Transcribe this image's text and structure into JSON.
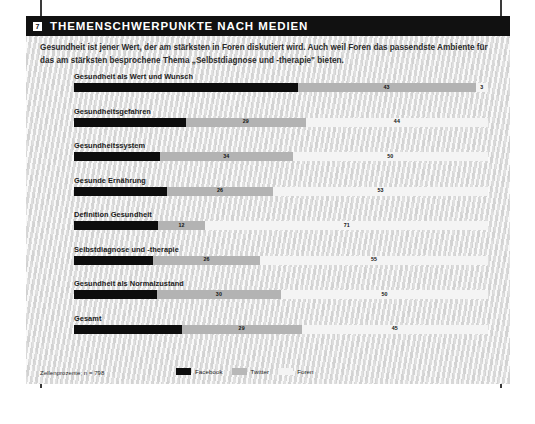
{
  "header": {
    "badge_number": "7",
    "title": "THEMENSCHWERPUNKTE NACH MEDIEN"
  },
  "intro": {
    "text": "Gesundheit ist jener Wert, der am stärksten in Foren diskutiert wird. Auch weil Foren das passendste Ambiente für das am stärksten besprochene Thema „Selbstdiagnose und -therapie\" bieten."
  },
  "footer": {
    "source_note": "Zellenprozente; n = 798",
    "legend": [
      {
        "label": "Facebook",
        "color": "#0d0d0d",
        "key": "facebook"
      },
      {
        "label": "Twitter",
        "color": "#b8b8b8",
        "key": "twitter"
      },
      {
        "label": "Foren",
        "color": "#f4f4f4",
        "key": "foren"
      }
    ]
  },
  "chart_data": {
    "type": "bar",
    "orientation": "horizontal",
    "stacked": true,
    "stack_total": 100,
    "title": "THEMENSCHWERPUNKTE NACH MEDIEN",
    "xlabel": "",
    "ylabel": "",
    "xlim": [
      0,
      100
    ],
    "grid": false,
    "legend_position": "bottom",
    "unit": "Zellenprozente",
    "n": 798,
    "categories": [
      "Gesundheit als Wert und Wunsch",
      "Gesundheitsgefahren",
      "Gesundheitssystem",
      "Gesunde Ernährung",
      "Definition Gesundheit",
      "Selbstdiagnose und -therapie",
      "Gesundheit als Normalzustand",
      "Gesamt"
    ],
    "series": [
      {
        "name": "Facebook",
        "color": "#0d0d0d",
        "values": [
          54,
          27,
          22,
          23,
          21,
          19,
          20,
          26
        ]
      },
      {
        "name": "Twitter",
        "color": "#b3b3b3",
        "values": [
          43,
          29,
          34,
          26,
          12,
          26,
          30,
          29
        ]
      },
      {
        "name": "Foren",
        "color": "#f4f4f4",
        "values": [
          3,
          44,
          50,
          53,
          71,
          55,
          50,
          45
        ]
      }
    ],
    "rows": [
      {
        "label": "Gesundheit als Wert und Wunsch",
        "segments": [
          {
            "series": "Facebook",
            "value": 54,
            "display": ""
          },
          {
            "series": "Twitter",
            "value": 43,
            "display": "43"
          },
          {
            "series": "Foren",
            "value": 3,
            "display": "3"
          }
        ]
      },
      {
        "label": "Gesundheitsgefahren",
        "segments": [
          {
            "series": "Facebook",
            "value": 27,
            "display": ""
          },
          {
            "series": "Twitter",
            "value": 29,
            "display": "29"
          },
          {
            "series": "Foren",
            "value": 44,
            "display": "44"
          }
        ]
      },
      {
        "label": "Gesundheitssystem",
        "segments": [
          {
            "series": "Facebook",
            "value": 22,
            "display": ""
          },
          {
            "series": "Twitter",
            "value": 34,
            "display": "34"
          },
          {
            "series": "Foren",
            "value": 50,
            "display": "50"
          }
        ]
      },
      {
        "label": "Gesunde Ernährung",
        "segments": [
          {
            "series": "Facebook",
            "value": 23,
            "display": ""
          },
          {
            "series": "Twitter",
            "value": 26,
            "display": "26"
          },
          {
            "series": "Foren",
            "value": 53,
            "display": "53"
          }
        ]
      },
      {
        "label": "Definition Gesundheit",
        "segments": [
          {
            "series": "Facebook",
            "value": 21,
            "display": ""
          },
          {
            "series": "Twitter",
            "value": 12,
            "display": "12"
          },
          {
            "series": "Foren",
            "value": 71,
            "display": "71"
          }
        ]
      },
      {
        "label": "Selbstdiagnose und -therapie",
        "segments": [
          {
            "series": "Facebook",
            "value": 19,
            "display": ""
          },
          {
            "series": "Twitter",
            "value": 26,
            "display": "26"
          },
          {
            "series": "Foren",
            "value": 55,
            "display": "55"
          }
        ]
      },
      {
        "label": "Gesundheit als Normalzustand",
        "segments": [
          {
            "series": "Facebook",
            "value": 20,
            "display": ""
          },
          {
            "series": "Twitter",
            "value": 30,
            "display": "30"
          },
          {
            "series": "Foren",
            "value": 50,
            "display": "50"
          }
        ]
      },
      {
        "label": "Gesamt",
        "segments": [
          {
            "series": "Facebook",
            "value": 26,
            "display": ""
          },
          {
            "series": "Twitter",
            "value": 29,
            "display": "29"
          },
          {
            "series": "Foren",
            "value": 45,
            "display": "45"
          }
        ]
      }
    ]
  }
}
